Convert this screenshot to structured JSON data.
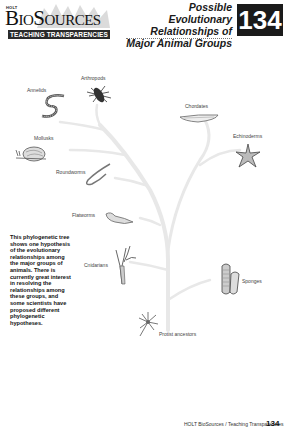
{
  "header": {
    "publisher": "HOLT",
    "brand": "BIOSOURCES",
    "brand_parts": {
      "b": "B",
      "io": "IO",
      "s": "S",
      "ources": "OURCES"
    },
    "series_bar": "TEACHING TRANSPARENCIES",
    "title_lines": [
      "Possible Evolutionary",
      "Relationships of",
      "Major Animal Groups"
    ],
    "number": "134"
  },
  "diagram": {
    "type": "phylogenetic-tree",
    "root": "Protist ancestors",
    "groups": [
      {
        "name": "Annelids",
        "icon": "segmented-worm"
      },
      {
        "name": "Arthropods",
        "icon": "insect"
      },
      {
        "name": "Chordates",
        "icon": "fish-lancelet"
      },
      {
        "name": "Echinoderms",
        "icon": "starfish"
      },
      {
        "name": "Mollusks",
        "icon": "snail"
      },
      {
        "name": "Roundworms",
        "icon": "roundworm"
      },
      {
        "name": "Flatworms",
        "icon": "flatworm"
      },
      {
        "name": "Cnidarians",
        "icon": "hydra"
      },
      {
        "name": "Sponges",
        "icon": "sponge"
      },
      {
        "name": "Protist ancestors",
        "icon": "protist"
      }
    ],
    "tree_color": "#e6e6e6"
  },
  "description": "This phylogenetic tree shows one hypothesis of the evolutionary relationships among the major groups of animals. There is currently great interest in resolving the relationships among these groups, and some scientists have proposed different phylogenetic hypotheses.",
  "footer": {
    "text": "HOLT BioSources / Teaching Transparencies",
    "page": "134"
  }
}
